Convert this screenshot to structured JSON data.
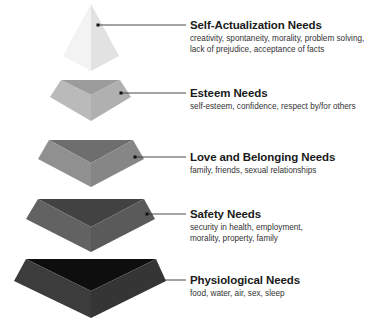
{
  "diagram": {
    "type": "hierarchy-pyramid",
    "levels": [
      {
        "title": "Self-Actualization Needs",
        "description": "creativity, spontaneity, morality, problem solving, lack of prejudice, acceptance of facts",
        "colors": {
          "left": "#f3f3f3",
          "right": "#e2e2e2"
        }
      },
      {
        "title": "Esteem Needs",
        "description": "self-esteem, confidence, respect by/for others",
        "colors": {
          "top": "#9c9c9c",
          "left": "#bababa",
          "right": "#b0b0b0"
        }
      },
      {
        "title": "Love and Belonging Needs",
        "description": "family, friends, sexual relationships",
        "colors": {
          "top": "#6e6e6e",
          "left": "#909090",
          "right": "#868686"
        }
      },
      {
        "title": "Safety Needs",
        "description": "security in health, employment, morality, property, family",
        "colors": {
          "top": "#424242",
          "left": "#626262",
          "right": "#5a5a5a"
        }
      },
      {
        "title": "Physiological Needs",
        "description": "food, water, air, sex, sleep",
        "colors": {
          "top": "#0e0e0e",
          "left": "#3c3c3c",
          "right": "#353535"
        }
      }
    ]
  }
}
